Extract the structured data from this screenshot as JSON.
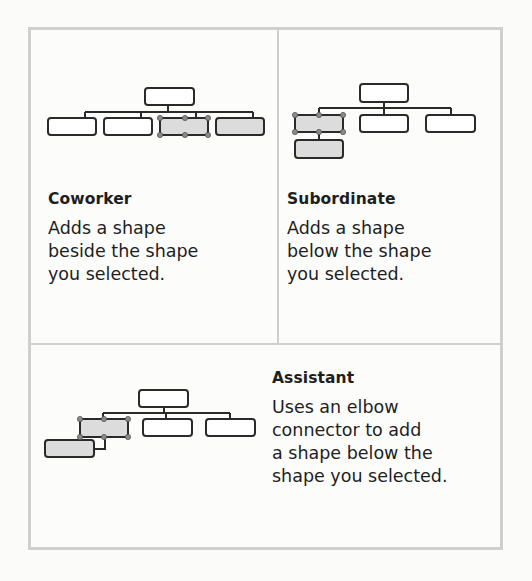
{
  "panels": [
    {
      "id": "coworker",
      "title": "Coworker",
      "description": "Adds a shape\nbeside the shape\nyou selected."
    },
    {
      "id": "subordinate",
      "title": "Subordinate",
      "description": "Adds a shape\nbelow the shape\nyou selected."
    },
    {
      "id": "assistant",
      "title": "Assistant",
      "description": "Uses an elbow\nconnector to add\na shape below the\nshape you selected."
    }
  ],
  "colors": {
    "frame_border": "#cfcfcd",
    "shape_stroke": "#2a2a2a",
    "selected_fill": "#dcdcdc",
    "new_shape_fill": "#dcdcdc",
    "handle_fill": "#8a8a8a"
  }
}
